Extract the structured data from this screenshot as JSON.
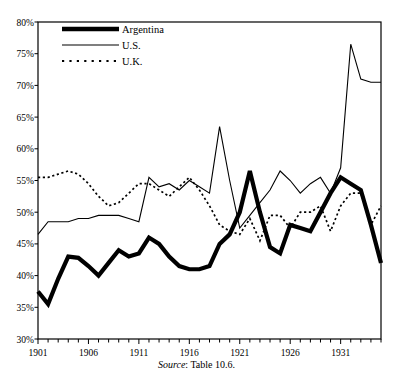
{
  "figure": {
    "source_prefix": "Source",
    "source_text": ": Table 10.6."
  },
  "legend": {
    "position": "top-left-inside",
    "entries": [
      {
        "label": "Argentina",
        "style": "thick-solid",
        "color": "#000000"
      },
      {
        "label": "U.S.",
        "style": "thin-solid",
        "color": "#000000"
      },
      {
        "label": "U.K.",
        "style": "dotted",
        "color": "#000000"
      }
    ]
  },
  "chart_data": {
    "type": "line",
    "title": "",
    "subtitle": "",
    "xlabel": "",
    "ylabel": "",
    "xlim": [
      1901,
      1935
    ],
    "ylim": [
      30,
      80
    ],
    "grid": false,
    "y_tick_labels": [
      "30%",
      "35%",
      "40%",
      "45%",
      "50%",
      "55%",
      "60%",
      "65%",
      "70%",
      "75%",
      "80%"
    ],
    "y_ticks": [
      30,
      35,
      40,
      45,
      50,
      55,
      60,
      65,
      70,
      75,
      80
    ],
    "x_tick_labels": [
      "1901",
      "1906",
      "1911",
      "1916",
      "1921",
      "1926",
      "1931"
    ],
    "x_ticks": [
      1901,
      1906,
      1911,
      1916,
      1921,
      1926,
      1931
    ],
    "x_minor_ticks_every": 1,
    "annotations": [
      "Source: Table 10.6."
    ],
    "x": [
      1901,
      1902,
      1903,
      1904,
      1905,
      1906,
      1907,
      1908,
      1909,
      1910,
      1911,
      1912,
      1913,
      1914,
      1915,
      1916,
      1917,
      1918,
      1919,
      1920,
      1921,
      1922,
      1923,
      1924,
      1925,
      1926,
      1927,
      1928,
      1929,
      1930,
      1931,
      1932,
      1933,
      1934,
      1935
    ],
    "series": [
      {
        "name": "Argentina",
        "style": "thick-solid",
        "values": [
          37.5,
          35.5,
          39.5,
          43.0,
          42.8,
          41.5,
          40.0,
          42.0,
          44.0,
          43.0,
          43.5,
          46.0,
          45.0,
          43.0,
          41.5,
          41.0,
          41.0,
          41.5,
          45.0,
          46.5,
          50.0,
          56.5,
          50.0,
          44.5,
          43.5,
          48.0,
          47.5,
          47.0,
          50.0,
          53.0,
          55.5,
          54.5,
          53.5,
          48.0,
          42.0
        ]
      },
      {
        "name": "U.S.",
        "style": "thin-solid",
        "values": [
          46.5,
          48.5,
          48.5,
          48.5,
          49.0,
          49.0,
          49.5,
          49.5,
          49.5,
          49.0,
          48.5,
          55.5,
          54.0,
          54.5,
          53.5,
          55.0,
          54.0,
          53.0,
          63.5,
          55.0,
          47.5,
          49.5,
          51.5,
          53.5,
          56.5,
          55.0,
          53.0,
          54.5,
          55.5,
          53.0,
          57.0,
          55.0,
          52.5,
          56.5,
          54.5
        ]
      },
      {
        "name": "U.K.",
        "style": "dotted",
        "values": [
          55.5,
          55.5,
          56.0,
          56.5,
          56.0,
          54.5,
          52.5,
          51.0,
          51.5,
          53.0,
          54.5,
          54.5,
          53.5,
          52.5,
          54.0,
          55.5,
          53.5,
          51.0,
          48.0,
          47.0,
          46.5,
          49.0,
          45.5,
          49.5,
          49.5,
          47.5,
          50.0,
          50.0,
          51.0,
          47.0,
          51.0,
          53.0,
          53.0,
          48.0,
          51.0
        ]
      }
    ],
    "series_values_detailed": {
      "note": "values as read from axes; Argentina thick black, U.S. thin black, U.K. dotted",
      "Argentina": [
        37.5,
        35.5,
        39.5,
        43.0,
        42.8,
        41.5,
        40.0,
        42.0,
        44.0,
        43.0,
        43.5,
        46.0,
        45.0,
        43.0,
        41.5,
        41.0,
        41.0,
        41.5,
        45.0,
        46.5,
        50.0,
        56.5,
        50.0,
        44.5,
        43.5,
        48.0,
        47.5,
        47.0,
        50.0,
        53.0,
        55.5,
        54.5,
        53.5,
        48.0,
        42.0
      ],
      "US": [
        46.5,
        48.5,
        48.5,
        48.5,
        49.0,
        49.0,
        49.5,
        49.5,
        49.5,
        49.0,
        48.5,
        55.5,
        54.0,
        54.5,
        53.5,
        55.0,
        54.0,
        53.0,
        63.5,
        55.0,
        47.5,
        49.5,
        51.5,
        53.5,
        56.5,
        55.0,
        53.0,
        54.5,
        55.5,
        53.0,
        57.0,
        76.5,
        71.0,
        70.5,
        70.5
      ],
      "UK": [
        55.5,
        55.5,
        56.0,
        56.5,
        56.0,
        54.5,
        52.5,
        51.0,
        51.5,
        53.0,
        54.5,
        54.5,
        53.5,
        52.5,
        54.0,
        55.5,
        53.5,
        51.0,
        48.0,
        47.0,
        46.5,
        49.0,
        45.5,
        49.5,
        49.5,
        47.5,
        50.0,
        50.0,
        51.0,
        47.0,
        51.0,
        53.0,
        53.0,
        48.0,
        51.0
      ]
    }
  }
}
